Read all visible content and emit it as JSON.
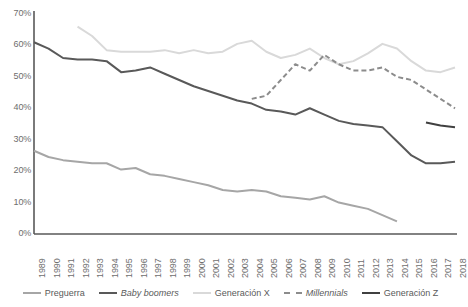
{
  "chart_data": {
    "type": "line",
    "title": "",
    "subtitle": "",
    "xlabel": "",
    "ylabel": "",
    "ylim": [
      0,
      70
    ],
    "ytick_labels": [
      "0%",
      "10%",
      "20%",
      "30%",
      "40%",
      "50%",
      "60%",
      "70%"
    ],
    "ytick_values": [
      0,
      10,
      20,
      30,
      40,
      50,
      60,
      70
    ],
    "grid": false,
    "legend_position": "bottom",
    "x": [
      1989,
      1990,
      1991,
      1992,
      1993,
      1994,
      1995,
      1996,
      1997,
      1998,
      1999,
      2000,
      2001,
      2002,
      2003,
      2004,
      2005,
      2006,
      2007,
      2008,
      2009,
      2010,
      2011,
      2012,
      2013,
      2014,
      2015,
      2016,
      2017,
      2018
    ],
    "xtick_labels": [
      "1989",
      "1990",
      "1991",
      "1992",
      "1993",
      "1994",
      "1995",
      "1996",
      "1997",
      "1998",
      "1999",
      "2000",
      "2001",
      "2002",
      "2003",
      "2004",
      "2005",
      "2006",
      "2007",
      "2008",
      "2009",
      "2010",
      "2011",
      "2012",
      "2013",
      "2014",
      "2015",
      "2016",
      "2017",
      "2018"
    ],
    "series": [
      {
        "name": "Preguerra",
        "color": "#a6a6a6",
        "style": "solid",
        "italic": false,
        "x": [
          1989,
          1990,
          1991,
          1992,
          1993,
          1994,
          1995,
          1996,
          1997,
          1998,
          1999,
          2000,
          2001,
          2002,
          2003,
          2004,
          2005,
          2006,
          2007,
          2008,
          2009,
          2010,
          2011,
          2012,
          2013,
          2014
        ],
        "values": [
          26.5,
          24.5,
          23.5,
          23.0,
          22.5,
          22.5,
          20.5,
          21.0,
          19.0,
          18.5,
          17.5,
          16.5,
          15.5,
          14.0,
          13.5,
          14.0,
          13.5,
          12.0,
          11.5,
          11.0,
          12.0,
          10.0,
          9.0,
          8.0,
          6.0,
          4.0
        ]
      },
      {
        "name": "Baby boomers",
        "color": "#595959",
        "style": "solid",
        "italic": true,
        "x": [
          1989,
          1990,
          1991,
          1992,
          1993,
          1994,
          1995,
          1996,
          1997,
          1998,
          1999,
          2000,
          2001,
          2002,
          2003,
          2004,
          2005,
          2006,
          2007,
          2008,
          2009,
          2010,
          2011,
          2012,
          2013,
          2014,
          2015,
          2016,
          2017,
          2018
        ],
        "values": [
          61.0,
          59.0,
          56.0,
          55.5,
          55.5,
          55.0,
          51.5,
          52.0,
          53.0,
          51.0,
          49.0,
          47.0,
          45.5,
          44.0,
          42.5,
          41.5,
          39.5,
          39.0,
          38.0,
          40.0,
          38.0,
          36.0,
          35.0,
          34.5,
          34.0,
          29.5,
          25.0,
          22.5,
          22.5,
          23.0
        ]
      },
      {
        "name": "Generación X",
        "color": "#d9d9d9",
        "style": "solid",
        "italic": false,
        "x": [
          1992,
          1993,
          1994,
          1995,
          1996,
          1997,
          1998,
          1999,
          2000,
          2001,
          2002,
          2003,
          2004,
          2005,
          2006,
          2007,
          2008,
          2009,
          2010,
          2011,
          2012,
          2013,
          2014,
          2015,
          2016,
          2017,
          2018
        ],
        "values": [
          66.0,
          63.0,
          58.5,
          58.0,
          58.0,
          58.0,
          58.5,
          57.5,
          58.5,
          57.5,
          58.0,
          60.5,
          61.5,
          58.0,
          56.0,
          57.0,
          59.0,
          56.0,
          54.0,
          55.0,
          57.5,
          60.5,
          59.0,
          55.0,
          52.0,
          51.5,
          53.0
        ]
      },
      {
        "name": "Millennials",
        "color": "#8c8c8c",
        "style": "dashed",
        "italic": true,
        "x": [
          2004,
          2005,
          2006,
          2007,
          2008,
          2009,
          2010,
          2011,
          2012,
          2013,
          2014,
          2015,
          2016,
          2017,
          2018
        ],
        "values": [
          43.0,
          44.0,
          49.0,
          54.0,
          52.0,
          57.0,
          54.0,
          52.0,
          52.0,
          53.0,
          50.0,
          49.0,
          46.0,
          43.0,
          40.0
        ]
      },
      {
        "name": "Generación Z",
        "color": "#404040",
        "style": "solid",
        "italic": false,
        "x": [
          2016,
          2017,
          2018
        ],
        "values": [
          35.5,
          34.5,
          34.0
        ]
      }
    ]
  },
  "legend": {
    "items": [
      {
        "label": "Preguerra"
      },
      {
        "label": "Baby boomers"
      },
      {
        "label": "Generación X"
      },
      {
        "label": "Millennials"
      },
      {
        "label": "Generación Z"
      }
    ]
  },
  "axis": {
    "line_color": "#595959"
  }
}
